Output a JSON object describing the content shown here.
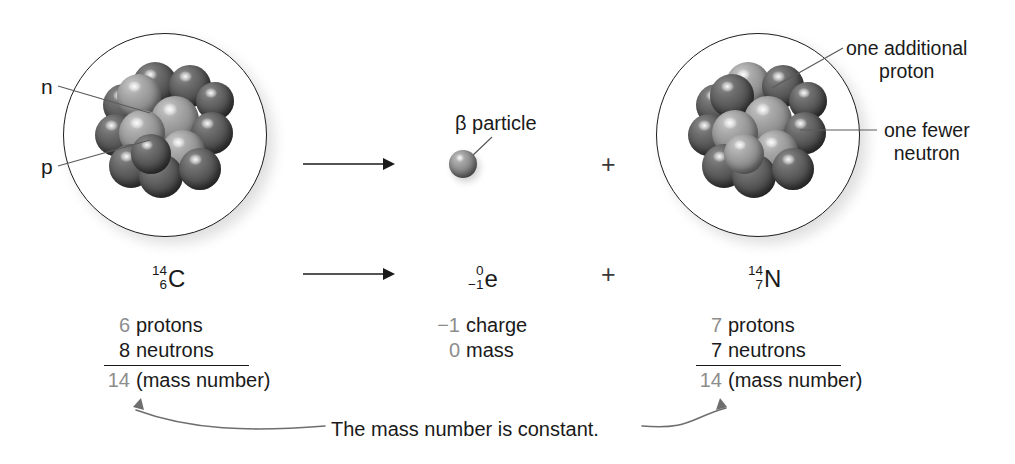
{
  "diagram": {
    "colors": {
      "ink": "#1a1a1a",
      "gray_number": "#8d8d8d",
      "leader_line": "#5a5a5a",
      "proton_sphere": "#888888",
      "neutron_sphere": "#4c4c4c"
    }
  },
  "left_atom": {
    "label_neutron": "n",
    "label_proton": "p",
    "isotope": {
      "mass_number": "14",
      "atomic_number": "6",
      "symbol": "C"
    },
    "tally": {
      "protons": {
        "count": "6",
        "label": "protons"
      },
      "neutrons": {
        "count": "8",
        "label": "neutrons"
      },
      "total": {
        "count": "14",
        "label": "(mass number)"
      }
    }
  },
  "beta": {
    "particle_label": "β particle",
    "isotope": {
      "mass_number": "0",
      "atomic_number": "−1",
      "symbol": "e"
    },
    "tally": {
      "charge": {
        "count": "−1",
        "label": "charge"
      },
      "mass": {
        "count": "0",
        "label": "mass"
      }
    }
  },
  "right_atom": {
    "callout_proton": {
      "line1": "one additional",
      "line2": "proton"
    },
    "callout_neutron": {
      "line1": "one fewer",
      "line2": "neutron"
    },
    "isotope": {
      "mass_number": "14",
      "atomic_number": "7",
      "symbol": "N"
    },
    "tally": {
      "protons": {
        "count": "7",
        "label": "protons"
      },
      "neutrons": {
        "count": "7",
        "label": "neutrons"
      },
      "total": {
        "count": "14",
        "label": "(mass number)"
      }
    }
  },
  "operators": {
    "plus_top": "+",
    "plus_bottom": "+"
  },
  "footer": {
    "caption": "The mass number is constant."
  }
}
